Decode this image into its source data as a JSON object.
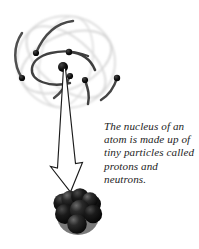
{
  "figure": {
    "background_color": "#ffffff",
    "caption": {
      "text": "The nucleus of an\natom is made up of\ntiny particles called\nprotons and\nneutrons.",
      "lines": [
        "The nucleus of an",
        "atom is made up of",
        "tiny particles called",
        "protons and",
        "neutrons."
      ],
      "style": "italic-serif",
      "color": "#1d1d1d"
    },
    "atom": {
      "label": "atom-model",
      "nucleus_dot_color": "#111111",
      "electron_color": "#151515",
      "orbit_faint_color": "#cfcfcf",
      "orbit_arc_color": "#3c3c3c",
      "electron_count": 6,
      "orbit_count": 3,
      "electrons": [
        {
          "name": "electron-upper-left",
          "cx": 36,
          "cy": 53,
          "r": 3.1
        },
        {
          "name": "electron-lower-left",
          "cx": 22,
          "cy": 78,
          "r": 3.1
        },
        {
          "name": "electron-top-center",
          "cx": 69,
          "cy": 52,
          "r": 3.2
        },
        {
          "name": "electron-mid-right",
          "cx": 70,
          "cy": 76,
          "r": 3.1
        },
        {
          "name": "electron-right-inner",
          "cx": 85,
          "cy": 80,
          "r": 3.1
        },
        {
          "name": "electron-far-right",
          "cx": 117,
          "cy": 78,
          "r": 3.2
        }
      ],
      "center": {
        "name": "nucleus-point",
        "cx": 63,
        "cy": 67,
        "r": 5.0
      }
    },
    "arrow": {
      "label": "magnify-arrow",
      "style": "hollow-outlined",
      "outline_color": "#1b1b1b",
      "fill_color": "#ffffff",
      "from": {
        "x": 64,
        "y": 68
      },
      "to": {
        "x": 70,
        "y": 190
      }
    },
    "nucleus": {
      "label": "nucleus-cluster",
      "particle_label": "nucleon",
      "particle_count": 9,
      "base_color": "#1e1e1e",
      "shadow_color": "#080808",
      "highlight_color": "#5a5a5a",
      "particles": [
        {
          "name": "nucleon-back-left",
          "cx": 63,
          "cy": 203,
          "r": 9.6,
          "shade": "#191919"
        },
        {
          "name": "nucleon-back-right",
          "cx": 92,
          "cy": 204,
          "r": 9.0,
          "shade": "#161616"
        },
        {
          "name": "nucleon-top-left",
          "cx": 70,
          "cy": 199,
          "r": 8.6,
          "shade": "#242424"
        },
        {
          "name": "nucleon-top-center",
          "cx": 80,
          "cy": 197,
          "r": 8.8,
          "shade": "#1c1c1c"
        },
        {
          "name": "nucleon-top-right",
          "cx": 90,
          "cy": 200,
          "r": 7.8,
          "shade": "#202020"
        },
        {
          "name": "nucleon-mid-left",
          "cx": 65,
          "cy": 214,
          "r": 10.0,
          "shade": "#131313"
        },
        {
          "name": "nucleon-mid-center",
          "cx": 80,
          "cy": 210,
          "r": 10.2,
          "shade": "#242424"
        },
        {
          "name": "nucleon-mid-right",
          "cx": 93,
          "cy": 214,
          "r": 9.2,
          "shade": "#1a1a1a"
        },
        {
          "name": "nucleon-front-bottom",
          "cx": 77,
          "cy": 224,
          "r": 9.8,
          "shade": "#202020"
        }
      ]
    }
  }
}
